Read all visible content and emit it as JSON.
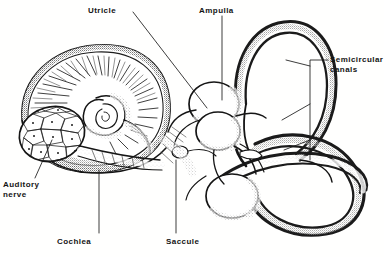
{
  "figure": {
    "style": "engraving",
    "background_color": "#ffffff",
    "ink_color": "#141414",
    "width": 384,
    "height": 257
  },
  "labels": [
    {
      "id": "utricle",
      "text": "Utricle",
      "x": 88,
      "y": 6,
      "leader_to": [
        207,
        110
      ]
    },
    {
      "id": "ampulla",
      "text": "Ampulla",
      "x": 199,
      "y": 6,
      "leader_to": [
        222,
        100
      ]
    },
    {
      "id": "semicircular_canals",
      "text": "Semicircular\ncanals",
      "x": 330,
      "y": 55,
      "leader_to": [
        310,
        150
      ]
    },
    {
      "id": "auditory_nerve",
      "text": "Auditory\nnerve",
      "x": 3,
      "y": 180,
      "leader_to": [
        52,
        140
      ]
    },
    {
      "id": "cochlea",
      "text": "Cochlea",
      "x": 57,
      "y": 237,
      "leader_to": [
        99,
        170
      ]
    },
    {
      "id": "saccule",
      "text": "Saccule",
      "x": 166,
      "y": 237,
      "leader_to": [
        176,
        160
      ]
    }
  ],
  "parts": [
    {
      "id": "cochlea-spiral",
      "name": "cochlea"
    },
    {
      "id": "auditory-nerve-bundle",
      "name": "auditory nerve cross-section"
    },
    {
      "id": "utricle-sac",
      "name": "utricle"
    },
    {
      "id": "saccule-sac",
      "name": "saccule"
    },
    {
      "id": "ampulla-sac",
      "name": "ampulla"
    },
    {
      "id": "canal-superior",
      "name": "superior semicircular canal"
    },
    {
      "id": "canal-posterior",
      "name": "posterior semicircular canal"
    },
    {
      "id": "canal-lateral",
      "name": "lateral semicircular canal"
    }
  ]
}
